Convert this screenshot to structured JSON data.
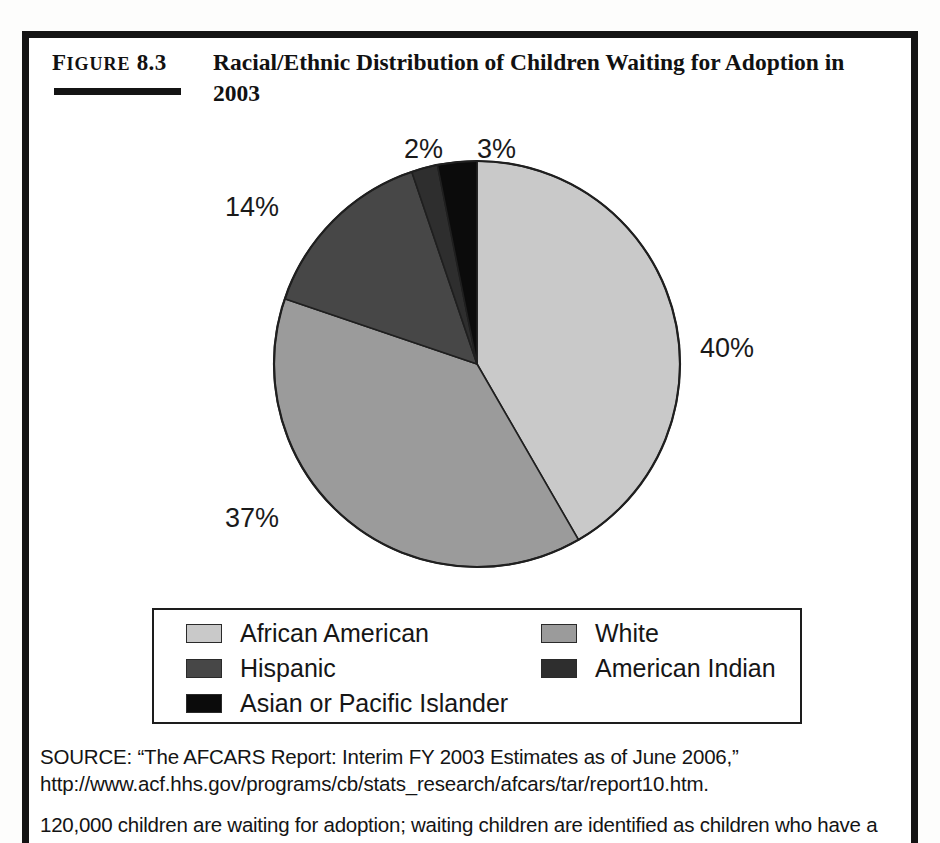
{
  "figure": {
    "number_caps": "IGURE",
    "number_lead": "F",
    "number_value": "8.3",
    "number_full": "FIGURE 8.3",
    "title": "Racial/Ethnic Distribution of Children Waiting for Adoption in 2003"
  },
  "chart_data": {
    "type": "pie",
    "title": "Racial/Ethnic Distribution of Children Waiting for Adoption in 2003",
    "categories": [
      "African American",
      "White",
      "Hispanic",
      "American Indian",
      "Asian or Pacific Islander"
    ],
    "values": [
      40,
      37,
      14,
      2,
      3
    ],
    "value_labels": [
      "40%",
      "37%",
      "14%",
      "2%",
      "3%"
    ],
    "unit": "percent",
    "start_angle_deg": 0,
    "direction": "clockwise",
    "colors": [
      "#c9c9c9",
      "#9b9b9b",
      "#474747",
      "#2e2e2e",
      "#0b0b0b"
    ],
    "legend_position": "bottom",
    "grid": false,
    "xlabel": "",
    "ylabel": ""
  },
  "legend": {
    "items": [
      {
        "label": "African American",
        "color": "#c9c9c9"
      },
      {
        "label": "White",
        "color": "#9b9b9b"
      },
      {
        "label": "Hispanic",
        "color": "#474747"
      },
      {
        "label": "American Indian",
        "color": "#2e2e2e"
      },
      {
        "label": "Asian or Pacific Islander",
        "color": "#0b0b0b"
      }
    ]
  },
  "source": {
    "text": "SOURCE: “The AFCARS Report: Interim FY 2003 Estimates as of June 2006,” http://www.acf.hhs.gov/programs/cb/stats_research/afcars/tar/report10.htm.",
    "note": "120,000 children are waiting for adoption; waiting children are identified as children who have a"
  }
}
